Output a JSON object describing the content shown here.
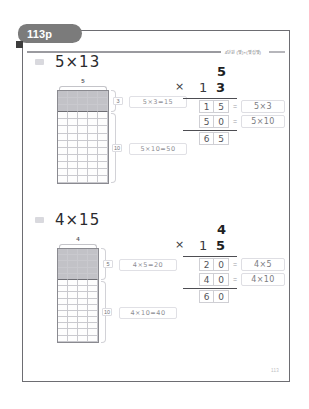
{
  "badge": {
    "label": "113p"
  },
  "header": {
    "unit_label": "4단원 (몇)×(몇십몇)"
  },
  "footer": {
    "page_number": "113"
  },
  "problems": [
    {
      "marker": "",
      "title": "5×13",
      "model": {
        "top_label": "5",
        "cols": 5,
        "rows": 13,
        "shaded_rows": 3,
        "brace_top_label": "3",
        "brace_bottom_label": "10"
      },
      "side_equations": [
        {
          "text": "5×3=15"
        },
        {
          "text": "5×10=50"
        }
      ],
      "vertical": {
        "multiplicand": "5",
        "operator": "×",
        "multiplier_tens": "1",
        "multiplier_ones": "3",
        "partial1": [
          "1",
          "5"
        ],
        "partial1_note": "5×3",
        "partial2": [
          "5",
          "0"
        ],
        "partial2_note": "5×10",
        "total": [
          "6",
          "5"
        ],
        "dash": "="
      }
    },
    {
      "marker": "",
      "title": "4×15",
      "model": {
        "top_label": "4",
        "cols": 4,
        "rows": 15,
        "shaded_rows": 5,
        "brace_top_label": "5",
        "brace_bottom_label": "10"
      },
      "side_equations": [
        {
          "text": "4×5=20"
        },
        {
          "text": "4×10=40"
        }
      ],
      "vertical": {
        "multiplicand": "4",
        "operator": "×",
        "multiplier_tens": "1",
        "multiplier_ones": "5",
        "partial1": [
          "2",
          "0"
        ],
        "partial1_note": "4×5",
        "partial2": [
          "4",
          "0"
        ],
        "partial2_note": "4×10",
        "total": [
          "6",
          "0"
        ],
        "dash": "="
      }
    }
  ],
  "colors": {
    "badge_bg": "#7b7b7b",
    "frame_border": "#6d6d72",
    "shade": "#c2c2c7",
    "grid_line": "#c9c9ce"
  }
}
